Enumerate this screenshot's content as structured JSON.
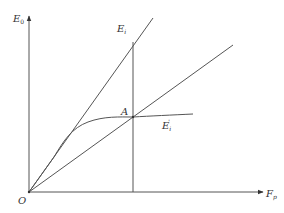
{
  "diagram": {
    "type": "line-diagram",
    "axes": {
      "y_label": "E",
      "y_label_sub": "0",
      "x_label": "F",
      "x_label_sub": "p",
      "origin_label": "O"
    },
    "curves": [
      {
        "id": "steep-line",
        "label": "E",
        "label_sub": "i",
        "label_sup": ""
      },
      {
        "id": "secant-line",
        "label": "",
        "label_sub": "",
        "label_sup": ""
      },
      {
        "id": "saturation-curve",
        "label": "E",
        "label_sub": "i",
        "label_sup": "'"
      }
    ],
    "points": [
      {
        "id": "A",
        "label": "A"
      }
    ],
    "colors": {
      "line": "#555555",
      "text": "#333333",
      "background": "#ffffff"
    }
  }
}
